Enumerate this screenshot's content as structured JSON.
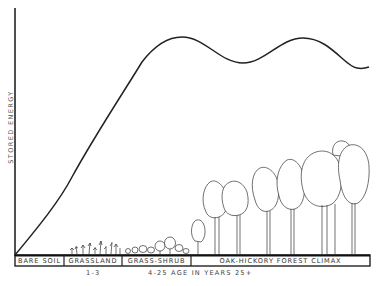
{
  "diagram": {
    "y_axis_label": "STORED ENERGY",
    "stages": [
      {
        "label": "BARE SOIL",
        "x_start": 15,
        "x_end": 64
      },
      {
        "label": "GRASSLAND",
        "x_start": 64,
        "x_end": 122
      },
      {
        "label": "GRASS-SHRUB",
        "x_start": 122,
        "x_end": 191
      },
      {
        "label": "OAK-HICKORY FOREST CLIMAX",
        "x_start": 191,
        "x_end": 370
      }
    ],
    "age_labels": {
      "grassland": "1-3",
      "middle": "4-25 AGE IN YEARS 25+"
    },
    "curve_description": "Stored energy rises from zero at bare soil, peaks in early forest, then oscillates around a plateau at climax",
    "colors": {
      "line": "#222222",
      "background": "#ffffff",
      "text": "#333333"
    }
  }
}
